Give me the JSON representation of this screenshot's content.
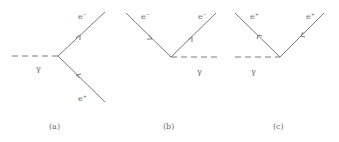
{
  "figure": {
    "diagrams": [
      {
        "id": "a",
        "caption": "(a)",
        "photon_label": "γ",
        "upper_label": "e⁻",
        "lower_label": "e⁺"
      },
      {
        "id": "b",
        "caption": "(b)",
        "photon_label": "γ",
        "left_label": "e⁻",
        "right_label": "e⁻"
      },
      {
        "id": "c",
        "caption": "(c)",
        "photon_label": "γ",
        "left_label": "e⁺",
        "right_label": "e⁺"
      }
    ]
  }
}
